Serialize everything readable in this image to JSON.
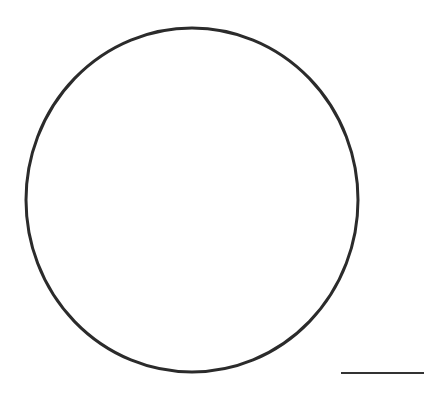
{
  "canvas": {
    "width": 446,
    "height": 401,
    "background": "#ffffff"
  },
  "shapes": {
    "circle": {
      "cx": 192,
      "cy": 200,
      "rx": 166,
      "ry": 172,
      "stroke": "#2b2b2b",
      "stroke_width": 3
    },
    "scale_line": {
      "x1": 341,
      "y1": 373,
      "x2": 424,
      "y2": 373,
      "stroke": "#333333",
      "stroke_width": 2
    }
  }
}
